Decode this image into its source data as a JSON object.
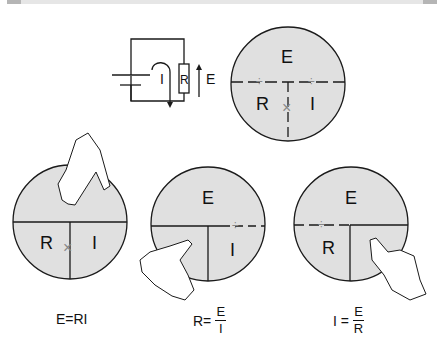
{
  "circuit": {
    "current_label": "I",
    "resistor_label": "R",
    "voltage_label": "E"
  },
  "triangle_main": {
    "top": "E",
    "left": "R",
    "right": "I",
    "divide": "÷",
    "multiply": "×"
  },
  "panel_e": {
    "top": "E",
    "left": "R",
    "right": "I",
    "multiply": "×"
  },
  "panel_r": {
    "top": "E",
    "right": "I",
    "divide": "÷"
  },
  "panel_i": {
    "top": "E",
    "left": "R",
    "divide": "÷"
  },
  "formulas": {
    "e": "E=RI",
    "r": {
      "lhs": "R=",
      "num": "E",
      "den": "I"
    },
    "i": {
      "lhs": "I =",
      "num": "E",
      "den": "R"
    }
  },
  "colors": {
    "circle_fill": "#e0e0e0",
    "stroke": "#1a1a1a",
    "muted": "#888888"
  }
}
